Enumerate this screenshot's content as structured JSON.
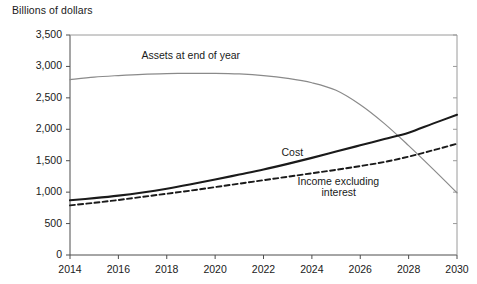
{
  "chart_data": {
    "type": "line",
    "title": "",
    "ylabel": "Billions of dollars",
    "xlabel": "",
    "ylim": [
      0,
      3500
    ],
    "xlim": [
      2014,
      2030
    ],
    "grid": false,
    "legend_position": "inline-annotations",
    "ytick_labels": [
      "0",
      "500",
      "1,000",
      "1,500",
      "2,000",
      "2,500",
      "3,000",
      "3,500"
    ],
    "ytick_values": [
      0,
      500,
      1000,
      1500,
      2000,
      2500,
      3000,
      3500
    ],
    "xtick_labels": [
      "2014",
      "2016",
      "2018",
      "2020",
      "2022",
      "2024",
      "2026",
      "2028",
      "2030"
    ],
    "xtick_values": [
      2014,
      2016,
      2018,
      2020,
      2022,
      2024,
      2026,
      2028,
      2030
    ],
    "x": [
      2014,
      2015,
      2016,
      2017,
      2018,
      2019,
      2020,
      2021,
      2022,
      2023,
      2024,
      2025,
      2026,
      2027,
      2028,
      2029,
      2030
    ],
    "series": [
      {
        "name": "Assets at end of year",
        "style": "solid",
        "color": "#8a8a8a",
        "width": 1.2,
        "values": [
          2790,
          2830,
          2855,
          2875,
          2885,
          2890,
          2890,
          2880,
          2855,
          2810,
          2740,
          2620,
          2390,
          2090,
          1740,
          1370,
          990
        ]
      },
      {
        "name": "Cost",
        "style": "solid",
        "color": "#1a1a1a",
        "width": 2.1,
        "values": [
          870,
          905,
          945,
          995,
          1055,
          1125,
          1200,
          1280,
          1360,
          1450,
          1545,
          1645,
          1745,
          1845,
          1945,
          2090,
          2230
        ]
      },
      {
        "name": "Income excluding interest",
        "style": "dashed",
        "color": "#1a1a1a",
        "width": 1.9,
        "values": [
          790,
          830,
          875,
          925,
          975,
          1025,
          1080,
          1135,
          1190,
          1245,
          1300,
          1355,
          1415,
          1480,
          1565,
          1665,
          1770
        ]
      }
    ],
    "annotations": [
      {
        "text": "Assets at end of year",
        "x": 2019.0,
        "y": 3160
      },
      {
        "text": "Cost",
        "x": 2023.2,
        "y": 1620
      },
      {
        "text": "Income excluding",
        "x": 2025.1,
        "y": 1160
      },
      {
        "text": "interest",
        "x": 2025.1,
        "y": 990
      }
    ]
  }
}
